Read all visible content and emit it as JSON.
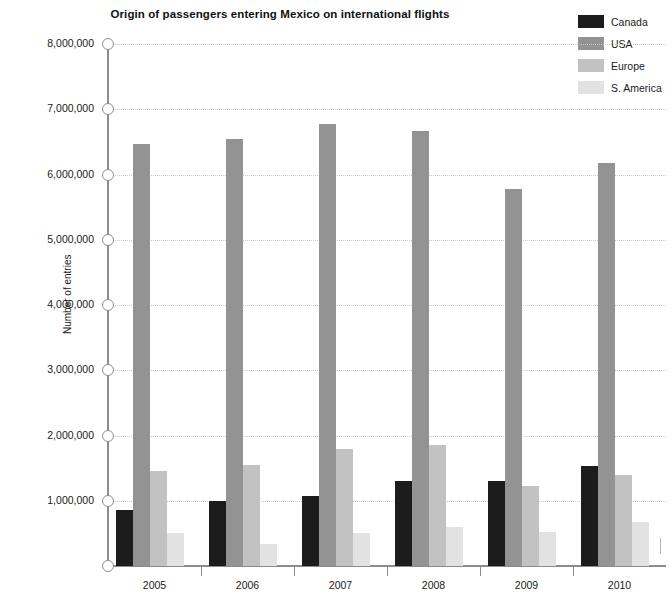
{
  "chart_data": {
    "type": "bar",
    "title": "Origin of passengers entering Mexico on international flights",
    "xlabel": "",
    "ylabel": "Number of entries",
    "categories": [
      "2005",
      "2006",
      "2007",
      "2008",
      "2009",
      "2010"
    ],
    "ylim": [
      0,
      8000000
    ],
    "yticks": [
      0,
      1000000,
      2000000,
      3000000,
      4000000,
      5000000,
      6000000,
      7000000,
      8000000
    ],
    "ytick_labels": [
      "",
      "1,000,000",
      "2,000,000",
      "3,000,000",
      "4,000,000",
      "5,000,000",
      "6,000,000",
      "7,000,000",
      "8,000,000"
    ],
    "grid": true,
    "legend_position": "top-right",
    "series": [
      {
        "name": "Canada",
        "color": "#1c1c1c",
        "values": [
          860000,
          1000000,
          1070000,
          1310000,
          1300000,
          1530000
        ]
      },
      {
        "name": "USA",
        "color": "#939393",
        "values": [
          6470000,
          6550000,
          6780000,
          6670000,
          5780000,
          6180000
        ]
      },
      {
        "name": "Europe",
        "color": "#c2c2c2",
        "values": [
          1450000,
          1550000,
          1800000,
          1850000,
          1220000,
          1400000
        ]
      },
      {
        "name": "S. America",
        "color": "#e2e2e2",
        "values": [
          500000,
          330000,
          500000,
          600000,
          520000,
          670000
        ]
      }
    ]
  },
  "axis": {
    "y_title": "Number of entries"
  }
}
